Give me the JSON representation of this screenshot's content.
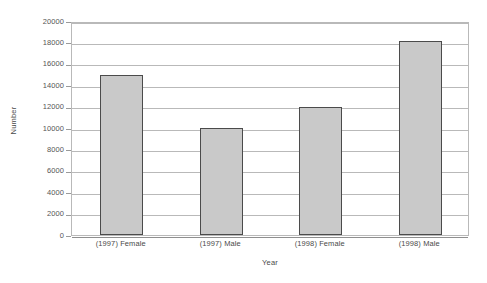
{
  "chart_data": {
    "type": "bar",
    "title": "",
    "xlabel": "Year",
    "ylabel": "Number",
    "categories": [
      "(1997) Female",
      "(1997) Male",
      "(1998) Female",
      "(1998) Male"
    ],
    "values": [
      15000,
      10000,
      12000,
      18100
    ],
    "ylim": [
      0,
      20000
    ],
    "ytick_values": [
      0,
      2000,
      4000,
      6000,
      8000,
      10000,
      12000,
      14000,
      16000,
      18000,
      20000
    ],
    "ytick_labels": [
      "0",
      "2000",
      "4000",
      "6000",
      "8000",
      "10000",
      "12000",
      "14000",
      "16000",
      "18000",
      "20000"
    ],
    "grid": "horizontal",
    "legend": "none",
    "series": [
      {
        "name": "Number",
        "values": [
          15000,
          10000,
          12000,
          18100
        ]
      }
    ],
    "colors": {
      "bar_fill": "#c9c9c9",
      "bar_edge": "#4b4b4b",
      "gridline": "#b9b9b9",
      "axis": "#8f8f8f",
      "text": "#4a4a4a",
      "background": "#ffffff"
    }
  }
}
